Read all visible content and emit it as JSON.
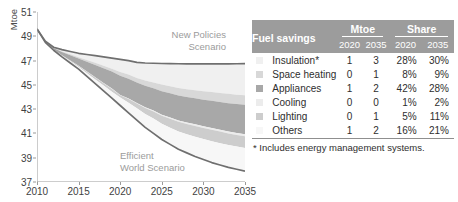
{
  "chart_data": {
    "type": "area",
    "title": "",
    "xlabel": "",
    "ylabel": "Mtoe",
    "xlim": [
      2010,
      2035
    ],
    "ylim": [
      37,
      51
    ],
    "yticks": [
      37,
      39,
      41,
      43,
      45,
      47,
      49,
      51
    ],
    "xticks": [
      2010,
      2015,
      2020,
      2025,
      2030,
      2035
    ],
    "grid": false,
    "legend": "table-at-right",
    "annotations": [
      {
        "text": "New Policies\nScenario",
        "x": 2026,
        "y": 48.2
      },
      {
        "text": "Efficient\nWorld Scenario",
        "x": 2026,
        "y": 38.9
      }
    ],
    "x": [
      2010,
      2011,
      2012,
      2013,
      2014,
      2015,
      2016,
      2017,
      2018,
      2019,
      2020,
      2021,
      2022,
      2023,
      2024,
      2025,
      2026,
      2027,
      2028,
      2029,
      2030,
      2031,
      2032,
      2033,
      2034,
      2035
    ],
    "series": [
      {
        "name": "New Policies Scenario",
        "role": "upper-bound-line",
        "color": "#6f6f6f",
        "values": [
          49.6,
          48.6,
          48.1,
          47.9,
          47.75,
          47.6,
          47.5,
          47.4,
          47.3,
          47.2,
          47.1,
          47.0,
          46.85,
          46.8,
          46.78,
          46.76,
          46.75,
          46.74,
          46.73,
          46.73,
          46.72,
          46.72,
          46.72,
          46.73,
          46.74,
          46.75
        ]
      },
      {
        "name": "Efficient World Scenario",
        "role": "lower-bound-line",
        "color": "#6f6f6f",
        "values": [
          49.6,
          48.5,
          47.85,
          47.3,
          46.8,
          46.3,
          45.7,
          45.1,
          44.5,
          43.9,
          43.3,
          42.7,
          42.1,
          41.5,
          41.0,
          40.5,
          40.1,
          39.7,
          39.4,
          39.1,
          38.85,
          38.6,
          38.4,
          38.2,
          38.05,
          37.9
        ]
      },
      {
        "name": "Insulation*",
        "role": "band",
        "color": "#f0f0f0",
        "values": [
          0,
          0.03,
          0.05,
          0.12,
          0.18,
          0.25,
          0.33,
          0.41,
          0.49,
          0.58,
          0.66,
          0.78,
          0.92,
          1.06,
          1.2,
          1.35,
          1.5,
          1.65,
          1.79,
          1.92,
          2.05,
          2.17,
          2.3,
          2.44,
          2.58,
          2.66
        ]
      },
      {
        "name": "Space heating",
        "role": "band",
        "color": "#d8d8d8",
        "values": [
          0,
          0.01,
          0.02,
          0.04,
          0.06,
          0.08,
          0.1,
          0.12,
          0.14,
          0.16,
          0.19,
          0.23,
          0.27,
          0.32,
          0.37,
          0.42,
          0.47,
          0.52,
          0.56,
          0.6,
          0.64,
          0.68,
          0.72,
          0.76,
          0.78,
          0.8
        ]
      },
      {
        "name": "Appliances",
        "role": "band",
        "color": "#a8a8a8",
        "values": [
          0,
          0.05,
          0.12,
          0.22,
          0.34,
          0.46,
          0.58,
          0.7,
          0.82,
          0.93,
          1.0,
          1.1,
          1.2,
          1.3,
          1.4,
          1.5,
          1.6,
          1.7,
          1.8,
          1.9,
          2.0,
          2.1,
          2.2,
          2.3,
          2.4,
          2.48
        ]
      },
      {
        "name": "Cooling",
        "role": "band",
        "color": "#ececec",
        "values": [
          0,
          0.0,
          0.0,
          0.01,
          0.01,
          0.01,
          0.01,
          0.02,
          0.02,
          0.02,
          0.02,
          0.03,
          0.04,
          0.05,
          0.06,
          0.07,
          0.08,
          0.09,
          0.1,
          0.12,
          0.13,
          0.14,
          0.15,
          0.16,
          0.17,
          0.18
        ]
      },
      {
        "name": "Lighting",
        "role": "band",
        "color": "#cdcdcd",
        "values": [
          0,
          0.01,
          0.02,
          0.03,
          0.05,
          0.07,
          0.09,
          0.11,
          0.13,
          0.15,
          0.12,
          0.2,
          0.28,
          0.36,
          0.44,
          0.52,
          0.6,
          0.67,
          0.73,
          0.79,
          0.84,
          0.88,
          0.92,
          0.95,
          0.97,
          0.98
        ]
      },
      {
        "name": "Others",
        "role": "band",
        "color": "#f7f7f7",
        "values": [
          0,
          0.0,
          0.04,
          0.08,
          0.11,
          0.13,
          0.19,
          0.24,
          0.3,
          0.36,
          0.41,
          0.56,
          0.69,
          0.81,
          0.93,
          1.0,
          1.1,
          1.21,
          1.32,
          1.44,
          1.54,
          1.65,
          1.73,
          1.82,
          1.89,
          1.95
        ]
      }
    ]
  },
  "chart": {
    "y_axis_title": "Mtoe",
    "y_tick_labels": [
      "51",
      "49",
      "47",
      "45",
      "43",
      "41",
      "39",
      "37"
    ],
    "x_tick_labels": [
      "2010",
      "2015",
      "2020",
      "2025",
      "2030",
      "2035"
    ],
    "label_new_policies": "New Policies\nScenario",
    "label_efficient_world": "Efficient\nWorld Scenario",
    "line_color": "#6f6f6f",
    "label_color": "#9b9b9b"
  },
  "table": {
    "header": {
      "row_label": "Fuel savings",
      "groups": [
        {
          "label": "Mtoe",
          "years": [
            "2020",
            "2035"
          ]
        },
        {
          "label": "Share",
          "years": [
            "2020",
            "2035"
          ]
        }
      ],
      "background": "#9c9c9c",
      "text_color": "#ffffff"
    },
    "rows": [
      {
        "swatch": "#f0f0f0",
        "category": "Insulation*",
        "mtoe_2020": "1",
        "mtoe_2035": "3",
        "share_2020": "28%",
        "share_2035": "30%"
      },
      {
        "swatch": "#d8d8d8",
        "category": "Space heating",
        "mtoe_2020": "0",
        "mtoe_2035": "1",
        "share_2020": "8%",
        "share_2035": "9%"
      },
      {
        "swatch": "#a8a8a8",
        "category": "Appliances",
        "mtoe_2020": "1",
        "mtoe_2035": "2",
        "share_2020": "42%",
        "share_2035": "28%"
      },
      {
        "swatch": "#ececec",
        "category": "Cooling",
        "mtoe_2020": "0",
        "mtoe_2035": "0",
        "share_2020": "1%",
        "share_2035": "2%"
      },
      {
        "swatch": "#cdcdcd",
        "category": "Lighting",
        "mtoe_2020": "0",
        "mtoe_2035": "1",
        "share_2020": "5%",
        "share_2035": "11%"
      },
      {
        "swatch": "#f7f7f7",
        "category": "Others",
        "mtoe_2020": "1",
        "mtoe_2035": "2",
        "share_2020": "16%",
        "share_2035": "21%"
      }
    ],
    "footnote": "* Includes energy management systems."
  }
}
